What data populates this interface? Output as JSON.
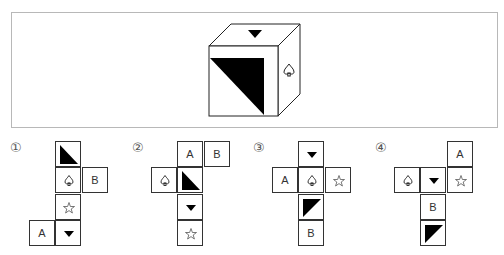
{
  "question": {
    "cube": {
      "top_face": "down-triangle",
      "front_face": "black-triangle-upper-right",
      "right_face": "spade"
    }
  },
  "options": [
    {
      "label": "①",
      "cells": [
        {
          "col": 1,
          "row": 0,
          "symbol": "black-triangle-lower-left",
          "text": ""
        },
        {
          "col": 1,
          "row": 1,
          "symbol": "spade",
          "text": ""
        },
        {
          "col": 2,
          "row": 1,
          "symbol": "text",
          "text": "B"
        },
        {
          "col": 1,
          "row": 2,
          "symbol": "star",
          "text": ""
        },
        {
          "col": 0,
          "row": 3,
          "symbol": "text",
          "text": "A"
        },
        {
          "col": 1,
          "row": 3,
          "symbol": "down-triangle",
          "text": ""
        }
      ]
    },
    {
      "label": "②",
      "cells": [
        {
          "col": 1,
          "row": 0,
          "symbol": "text",
          "text": "A"
        },
        {
          "col": 2,
          "row": 0,
          "symbol": "text",
          "text": "B"
        },
        {
          "col": 0,
          "row": 1,
          "symbol": "spade",
          "text": ""
        },
        {
          "col": 1,
          "row": 1,
          "symbol": "black-triangle-lower-left",
          "text": ""
        },
        {
          "col": 1,
          "row": 2,
          "symbol": "down-triangle",
          "text": ""
        },
        {
          "col": 1,
          "row": 3,
          "symbol": "star",
          "text": ""
        }
      ]
    },
    {
      "label": "③",
      "cells": [
        {
          "col": 1,
          "row": 0,
          "symbol": "down-triangle",
          "text": ""
        },
        {
          "col": 0,
          "row": 1,
          "symbol": "text",
          "text": "A"
        },
        {
          "col": 1,
          "row": 1,
          "symbol": "spade",
          "text": ""
        },
        {
          "col": 2,
          "row": 1,
          "symbol": "star",
          "text": ""
        },
        {
          "col": 1,
          "row": 2,
          "symbol": "black-triangle-upper-left",
          "text": ""
        },
        {
          "col": 1,
          "row": 3,
          "symbol": "text",
          "text": "B"
        }
      ]
    },
    {
      "label": "④",
      "cells": [
        {
          "col": 2,
          "row": 0,
          "symbol": "text",
          "text": "A"
        },
        {
          "col": 0,
          "row": 1,
          "symbol": "spade",
          "text": ""
        },
        {
          "col": 1,
          "row": 1,
          "symbol": "down-triangle",
          "text": ""
        },
        {
          "col": 2,
          "row": 1,
          "symbol": "star",
          "text": ""
        },
        {
          "col": 1,
          "row": 2,
          "symbol": "text",
          "text": "B"
        },
        {
          "col": 1,
          "row": 3,
          "symbol": "black-triangle-upper-left",
          "text": ""
        }
      ]
    }
  ],
  "layout": {
    "label_positions": [
      [
        10,
        140
      ],
      [
        132,
        140
      ],
      [
        253,
        140
      ],
      [
        375,
        140
      ]
    ],
    "net_origins": [
      [
        29,
        141
      ],
      [
        151,
        141
      ],
      [
        272,
        141
      ],
      [
        394,
        141
      ]
    ],
    "cell_size": 26.3
  },
  "colors": {
    "line": "#333333",
    "fill": "#000000",
    "frame": "#b8b8b8"
  }
}
